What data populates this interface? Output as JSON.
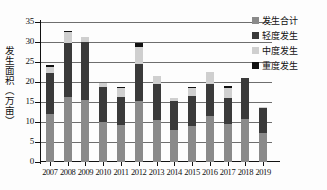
{
  "chart_data": {
    "type": "bar",
    "subtype": "stacked-bar",
    "title": "",
    "xlabel": "",
    "ylabel": "发生面积（万亩）",
    "ylim": [
      0,
      35
    ],
    "ytick_step": 5,
    "yticks": [
      "0",
      "5",
      "10",
      "15",
      "20",
      "25",
      "30",
      "35"
    ],
    "grid": true,
    "grid_axis": "y",
    "legend_position": "top-right",
    "categories": [
      "2007",
      "2008",
      "2009",
      "2010",
      "2011",
      "2012",
      "2013",
      "2014",
      "2015",
      "2016",
      "2017",
      "2018",
      "2019"
    ],
    "series": [
      {
        "name": "发生合计",
        "color": "#8a8a8a",
        "values": [
          12.0,
          16.3,
          15.5,
          10.0,
          9.2,
          15.2,
          10.5,
          8.1,
          9.1,
          11.4,
          9.4,
          10.7,
          7.2
        ]
      },
      {
        "name": "轻度发生",
        "color": "#3a3a3a",
        "values": [
          10.2,
          13.4,
          14.5,
          8.8,
          7.1,
          9.2,
          9.0,
          7.2,
          7.4,
          8.1,
          6.6,
          10.2,
          6.3
        ]
      },
      {
        "name": "中度发生",
        "color": "#cfcfcf",
        "values": [
          1.5,
          2.8,
          1.2,
          0.9,
          2.3,
          4.4,
          1.9,
          0.6,
          2.0,
          3.1,
          2.4,
          0.0,
          0.3
        ]
      },
      {
        "name": "重度发生",
        "color": "#111111",
        "values": [
          0.5,
          0.3,
          0.0,
          0.0,
          0.2,
          0.9,
          0.0,
          0.0,
          0.3,
          0.0,
          0.5,
          0.0,
          0.0
        ]
      }
    ],
    "totals": [
      24.2,
      32.8,
      31.2,
      19.7,
      18.8,
      29.7,
      21.4,
      15.9,
      18.8,
      22.6,
      18.9,
      20.9,
      13.8
    ]
  },
  "legend": {
    "items": [
      {
        "label": "发生合计",
        "color": "#8a8a8a"
      },
      {
        "label": "轻度发生",
        "color": "#3a3a3a"
      },
      {
        "label": "中度发生",
        "color": "#cfcfcf"
      },
      {
        "label": "重度发生",
        "color": "#111111"
      }
    ]
  },
  "axes": {
    "y_title": "发生面积（万亩）"
  }
}
